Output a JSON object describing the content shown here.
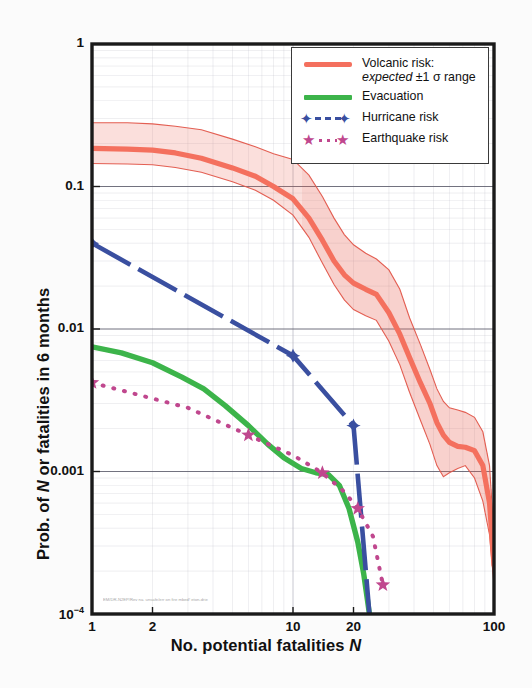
{
  "chart_data": {
    "type": "line",
    "title": "",
    "xlabel": "No. potential fatalities N",
    "ylabel": "Prob. of N or fatalities in 6 months",
    "xscale": "log",
    "yscale": "log",
    "xlim": [
      1,
      100
    ],
    "ylim": [
      0.0001,
      1
    ],
    "xticks": [
      "1",
      "2",
      "10",
      "20",
      "100"
    ],
    "xtick_values": [
      1,
      2,
      10,
      20,
      100
    ],
    "yticks": [
      "1",
      "0.1",
      "0.01",
      "0.001",
      "10-4"
    ],
    "ytick_values": [
      1,
      0.1,
      0.01,
      0.001,
      0.0001
    ],
    "grid": true,
    "legend_position": "top-right",
    "annotation": "EM/DR-N2EP/Rev na. unsafe/err on  fire  mbed! eton-drie",
    "series": [
      {
        "name": "Volcanic risk: expected",
        "color": "#F4705E",
        "style": "thick-solid",
        "x": [
          1,
          1.5,
          2,
          2.6,
          3.5,
          5,
          6.5,
          8,
          10,
          12,
          14,
          16,
          18,
          20,
          23,
          26,
          30,
          34,
          38,
          43,
          48,
          52,
          56,
          60,
          66,
          72,
          80,
          88,
          95,
          100
        ],
        "y": [
          0.185,
          0.183,
          0.18,
          0.172,
          0.158,
          0.135,
          0.118,
          0.1,
          0.082,
          0.06,
          0.042,
          0.03,
          0.024,
          0.021,
          0.019,
          0.0175,
          0.013,
          0.0092,
          0.0063,
          0.0042,
          0.003,
          0.0022,
          0.0018,
          0.0016,
          0.0015,
          0.00148,
          0.0014,
          0.0011,
          0.0006,
          0.00022
        ]
      },
      {
        "name": "Volcanic risk: upper +1 sigma",
        "color": "#E2564A",
        "style": "thin-solid",
        "x": [
          1,
          1.5,
          2,
          2.6,
          3.5,
          5,
          6.5,
          8,
          10,
          12,
          14,
          16,
          18,
          20,
          23,
          26,
          30,
          34,
          38,
          43,
          48,
          52,
          56,
          60,
          66,
          72,
          80,
          88,
          95,
          100
        ],
        "y": [
          0.28,
          0.28,
          0.275,
          0.265,
          0.25,
          0.215,
          0.19,
          0.17,
          0.155,
          0.12,
          0.085,
          0.06,
          0.046,
          0.039,
          0.034,
          0.031,
          0.026,
          0.019,
          0.012,
          0.0078,
          0.0052,
          0.0038,
          0.0031,
          0.0028,
          0.0027,
          0.0026,
          0.0024,
          0.0019,
          0.0011,
          0.00035
        ]
      },
      {
        "name": "Volcanic risk: lower -1 sigma",
        "color": "#E2564A",
        "style": "thin-solid",
        "x": [
          1,
          1.5,
          2,
          2.6,
          3.5,
          5,
          6.5,
          8,
          10,
          12,
          14,
          16,
          18,
          20,
          23,
          26,
          30,
          34,
          38,
          43,
          48,
          52,
          56,
          60,
          66,
          72,
          80,
          88,
          95,
          100
        ],
        "y": [
          0.145,
          0.144,
          0.142,
          0.136,
          0.126,
          0.108,
          0.094,
          0.08,
          0.063,
          0.044,
          0.029,
          0.0205,
          0.016,
          0.0137,
          0.0124,
          0.0115,
          0.0082,
          0.0056,
          0.0036,
          0.0023,
          0.00155,
          0.0011,
          0.00092,
          0.00098,
          0.00105,
          0.0011,
          0.0009,
          0.00062,
          0.00036,
          0.00016
        ]
      },
      {
        "name": "Evacuation",
        "color": "#3CB44A",
        "style": "thick-solid",
        "x": [
          1,
          1.4,
          2,
          2.8,
          3.6,
          4.6,
          6,
          7.5,
          9,
          11,
          13,
          15,
          17,
          19,
          21,
          22.5,
          24
        ],
        "y": [
          0.0075,
          0.0068,
          0.0058,
          0.0046,
          0.0038,
          0.0029,
          0.0021,
          0.00155,
          0.00125,
          0.00105,
          0.00098,
          0.00095,
          0.0008,
          0.00055,
          0.00032,
          0.00019,
          0.0001
        ]
      },
      {
        "name": "Hurricane risk",
        "color": "#3A4FA0",
        "style": "dashed-marker",
        "marker": "four-point-star",
        "x": [
          1,
          10,
          20,
          24
        ],
        "y": [
          0.04,
          0.0065,
          0.0021,
          0.0001
        ],
        "marker_x": [
          1,
          10,
          20
        ],
        "marker_y": [
          0.04,
          0.0065,
          0.0021
        ]
      },
      {
        "name": "Earthquake risk",
        "color": "#C0478E",
        "style": "dotted-marker",
        "marker": "five-point-star",
        "x": [
          1,
          3,
          6,
          10,
          14,
          18,
          21,
          25,
          28
        ],
        "y": [
          0.0042,
          0.0028,
          0.0018,
          0.0013,
          0.00098,
          0.00072,
          0.00055,
          0.00035,
          0.00016
        ],
        "marker_x": [
          1,
          6,
          14,
          21,
          28
        ],
        "marker_y": [
          0.0042,
          0.0018,
          0.00098,
          0.00055,
          0.00016
        ]
      }
    ]
  },
  "legend": {
    "items": [
      {
        "label_line1": "Volcanic risk:",
        "label_line2_pre": "expected",
        "label_line2_post": "±1 σ range",
        "key": "red-bar"
      },
      {
        "label_line1": "Evacuation",
        "label_line2_pre": "",
        "label_line2_post": "",
        "key": "green-bar"
      },
      {
        "label_line1": "Hurricane risk",
        "label_line2_pre": "",
        "label_line2_post": "",
        "key": "blue-dash-star"
      },
      {
        "label_line1": "Earthquake risk",
        "label_line2_pre": "",
        "label_line2_post": "",
        "key": "magenta-dot-star"
      }
    ]
  },
  "axes": {
    "xlabel_pre": "No. potential fatalities ",
    "xlabel_italic": "N",
    "ylabel_pre": "Prob. of ",
    "ylabel_italic": "N",
    "ylabel_post": " or fatalities in 6 months"
  },
  "colors": {
    "volcanic": "#F4705E",
    "volcanic_band": "#E2564A",
    "evacuation": "#3CB44A",
    "hurricane": "#3A4FA0",
    "earthquake": "#C0478E",
    "axis": "#1a1a1a",
    "grid": "#b9b9c4"
  }
}
